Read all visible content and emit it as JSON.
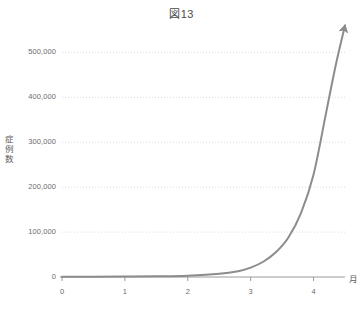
{
  "chart_data": {
    "type": "line",
    "title": "図13",
    "xlabel": "月",
    "ylabel": "症例数",
    "xlim": [
      0,
      4.5
    ],
    "ylim": [
      0,
      550000
    ],
    "grid": true,
    "legend": null,
    "xticks": [
      {
        "value": 0,
        "label": "0"
      },
      {
        "value": 1,
        "label": "1"
      },
      {
        "value": 2,
        "label": "2"
      },
      {
        "value": 3,
        "label": "3"
      },
      {
        "value": 4,
        "label": "4"
      }
    ],
    "yticks": [
      {
        "value": 0,
        "label": "0"
      },
      {
        "value": 100000,
        "label": "100,000"
      },
      {
        "value": 200000,
        "label": "200,000"
      },
      {
        "value": 300000,
        "label": "300,000"
      },
      {
        "value": 400000,
        "label": "400,000"
      },
      {
        "value": 500000,
        "label": "500,000"
      }
    ],
    "series": [
      {
        "name": "症例数",
        "color": "#8c8c8c",
        "arrow_end": true,
        "x": [
          0.0,
          0.5,
          1.0,
          1.5,
          2.0,
          2.5,
          2.8,
          3.0,
          3.2,
          3.4,
          3.6,
          3.8,
          4.0,
          4.2,
          4.35,
          4.5
        ],
        "y": [
          300,
          500,
          900,
          1600,
          3000,
          7000,
          13000,
          21000,
          34000,
          55000,
          88000,
          142000,
          228000,
          366000,
          470000,
          560000
        ]
      }
    ]
  },
  "axis_color": "#9a9a9a",
  "grid_color": "#d8d8d8"
}
